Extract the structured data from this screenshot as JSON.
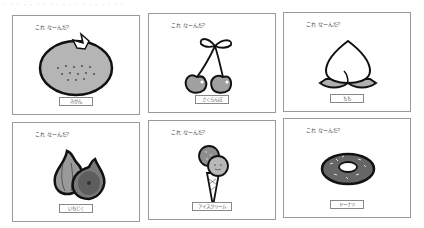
{
  "header": {
    "faint_text": "・・・・・・・・・・・・・・・・・・・"
  },
  "question_label": "これ なーんだ?",
  "cards": [
    {
      "id": "mikan",
      "question": "これ なーんだ?",
      "answer": "みかん",
      "icon": "mandarin-orange-icon"
    },
    {
      "id": "sakuranbo",
      "question": "これ なーんだ?",
      "answer": "さくらんぼ",
      "icon": "cherry-icon"
    },
    {
      "id": "momo",
      "question": "これ なーんだ?",
      "answer": "もも",
      "icon": "peach-icon"
    },
    {
      "id": "ichijiku",
      "question": "これ なーんだ?",
      "answer": "いちじく",
      "icon": "fig-icon"
    },
    {
      "id": "icecream",
      "question": "これ なーんだ?",
      "answer": "アイスクリーム",
      "icon": "ice-cream-icon"
    },
    {
      "id": "donut",
      "question": "これ なーんだ?",
      "answer": "ドーナツ",
      "icon": "donut-icon"
    }
  ],
  "colors": {
    "border": "#9a9a9a",
    "fill_gray": "#a8a8a8",
    "dark_gray": "#6e6e6e",
    "outline": "#111111"
  }
}
